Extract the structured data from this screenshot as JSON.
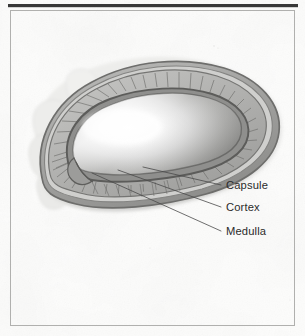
{
  "figure": {
    "view": "sagittal cross-section",
    "background_color": "#fbfbfa",
    "paper_tint": "#f4f4f2",
    "frame": {
      "border_color": "#a9a9a9",
      "top_rule_color": "#3a3a3a",
      "top_rule_thickness_px": 3,
      "border_thickness_px": 1,
      "inset_px": 10
    }
  },
  "labels": [
    {
      "id": "capsule",
      "text": "Capsule",
      "x": 225,
      "y": 189,
      "leader": {
        "from_x": 221,
        "from_y": 185,
        "to_x": 142,
        "to_y": 167
      },
      "target_structure": "outer capsule ring"
    },
    {
      "id": "cortex",
      "text": "Cortex",
      "x": 225,
      "y": 211,
      "leader": {
        "from_x": 221,
        "from_y": 207,
        "to_x": 118,
        "to_y": 170
      },
      "target_structure": "striated cortex band"
    },
    {
      "id": "medulla",
      "text": "Medulla",
      "x": 225,
      "y": 235,
      "leader": {
        "from_x": 221,
        "from_y": 231,
        "to_x": 93,
        "to_y": 173
      },
      "target_structure": "inner medulla core"
    }
  ],
  "anatomy": {
    "outer_lobes": {
      "name": "surrounding adipose lobes",
      "fill": "#e9e9e7",
      "stroke": "#cfcfcd",
      "opacity": 0.85
    },
    "capsule": {
      "name": "capsule",
      "fill": "#a8a8a6",
      "stroke": "#6f6f6d",
      "stroke_width": 1.6
    },
    "subcapsular_sinus": {
      "name": "subcapsular sinus",
      "fill": "#c4c4c2",
      "stroke": "#8c8c8a"
    },
    "cortex": {
      "name": "cortex",
      "fill": "#b4b4b2",
      "stroke": "#787876",
      "striation_color": "#6e6e6c",
      "striation_count": 46,
      "striation_width": 0.75
    },
    "inner_ring": {
      "name": "deep cortex boundary",
      "fill": "#8e8e8c",
      "stroke": "#5e5e5c",
      "stroke_width": 1.8
    },
    "medulla": {
      "name": "medulla",
      "fill_light": "#ffffff",
      "fill_mid": "#d8d8d6",
      "fill_dark": "#8a8a88",
      "stroke": "#6a6a68",
      "highlight_x": 120,
      "highlight_y": 128
    },
    "hilum": {
      "name": "hilum notch",
      "x": 78,
      "y": 168,
      "fill": "#9a9a98"
    }
  },
  "leader_line_style": {
    "color": "#4a4a4a",
    "width": 0.8
  }
}
